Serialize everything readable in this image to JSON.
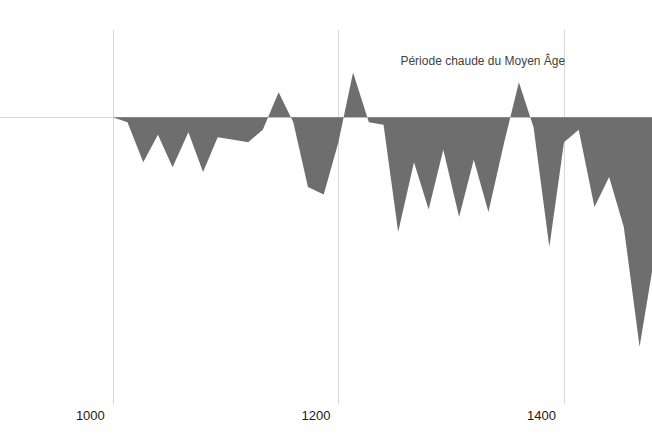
{
  "chart_data": {
    "type": "area",
    "title": "",
    "subtitle": "",
    "xlabel": "",
    "ylabel": "",
    "grid": true,
    "legend": "none",
    "colors": {
      "series_fill": "#6e6e6e",
      "gridline": "#d6d6d6",
      "zeroline": "#d6d6d6",
      "tick_text": "#1a1a1a",
      "annotation_text": "#3f3f3f",
      "background": "#ffffff"
    },
    "xlim": [
      900,
      1478
    ],
    "ylim": [
      -1.15,
      0.35
    ],
    "baseline": 0,
    "xticks": [
      1000,
      1200,
      1400
    ],
    "xtick_labels": [
      "1000",
      "1200",
      "1400"
    ],
    "yticks": [],
    "ytick_labels": [],
    "annotations": [
      {
        "text": "Période chaude du Moyen Âge",
        "x": 1255,
        "y": 0.21
      }
    ],
    "series": [
      {
        "name": "Anomalie de température",
        "x": [
          900,
          920,
          933,
          947,
          960,
          973,
          987,
          1000,
          1013,
          1027,
          1040,
          1053,
          1067,
          1080,
          1093,
          1107,
          1120,
          1133,
          1147,
          1160,
          1173,
          1187,
          1200,
          1213,
          1227,
          1240,
          1253,
          1267,
          1280,
          1293,
          1307,
          1320,
          1333,
          1347,
          1360,
          1373,
          1387,
          1400,
          1413,
          1427,
          1440,
          1453,
          1467,
          1478
        ],
        "values": [
          0.0,
          0.0,
          0.0,
          0.0,
          0.0,
          0.0,
          0.0,
          0.0,
          -0.02,
          -0.18,
          -0.07,
          -0.2,
          -0.06,
          -0.22,
          -0.08,
          -0.09,
          -0.1,
          -0.05,
          0.1,
          -0.02,
          -0.28,
          -0.31,
          -0.1,
          0.18,
          -0.02,
          -0.03,
          -0.46,
          -0.18,
          -0.37,
          -0.13,
          -0.4,
          -0.17,
          -0.38,
          -0.1,
          0.14,
          -0.04,
          -0.52,
          -0.1,
          -0.05,
          -0.36,
          -0.24,
          -0.44,
          -0.92,
          -0.62
        ]
      }
    ]
  }
}
